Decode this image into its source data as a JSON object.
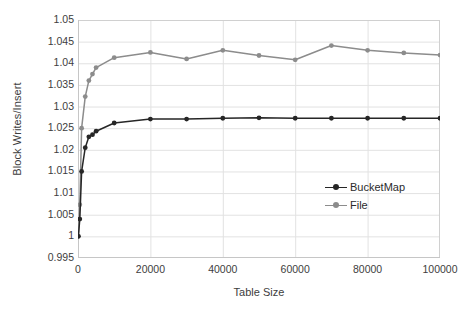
{
  "chart_data": {
    "type": "line",
    "title": "",
    "xlabel": "Table Size",
    "ylabel": "Block Writes/Insert",
    "xlim": [
      0,
      100000
    ],
    "ylim": [
      0.995,
      1.05
    ],
    "xticks": [
      0,
      20000,
      40000,
      60000,
      80000,
      100000
    ],
    "xtick_labels": [
      "0",
      "20000",
      "40000",
      "60000",
      "80000",
      "100000"
    ],
    "yticks": [
      0.995,
      1.0,
      1.005,
      1.01,
      1.015,
      1.02,
      1.025,
      1.03,
      1.035,
      1.04,
      1.045,
      1.05
    ],
    "ytick_labels": [
      "0.995",
      "1",
      "1.005",
      "1.01",
      "1.015",
      "1.02",
      "1.025",
      "1.03",
      "1.035",
      "1.04",
      "1.045",
      "1.05"
    ],
    "grid": true,
    "legend_position": "inside-right",
    "x": [
      100,
      500,
      1000,
      2000,
      3000,
      4000,
      5000,
      10000,
      20000,
      30000,
      40000,
      50000,
      60000,
      70000,
      80000,
      90000,
      100000
    ],
    "series": [
      {
        "name": "BucketMap",
        "color": "#262626",
        "marker": "circle",
        "values": [
          1.0,
          1.004,
          1.015,
          1.0205,
          1.023,
          1.0235,
          1.0243,
          1.0262,
          1.0271,
          1.0271,
          1.0273,
          1.0274,
          1.0273,
          1.0273,
          1.0273,
          1.0273,
          1.0273
        ]
      },
      {
        "name": "File",
        "color": "#8c8c8c",
        "marker": "circle",
        "values": [
          1.0,
          1.0073,
          1.025,
          1.0323,
          1.036,
          1.0375,
          1.039,
          1.0413,
          1.0425,
          1.041,
          1.043,
          1.0418,
          1.0408,
          1.0441,
          1.043,
          1.0424,
          1.0419
        ]
      }
    ]
  },
  "legend": {
    "items": [
      {
        "label": "BucketMap",
        "color": "#262626"
      },
      {
        "label": "File",
        "color": "#8c8c8c"
      }
    ]
  },
  "colors": {
    "bucketmap": "#262626",
    "file": "#8c8c8c",
    "grid": "#e2e2e2",
    "axis": "#d0d0d0",
    "text": "#3d3d3d"
  }
}
